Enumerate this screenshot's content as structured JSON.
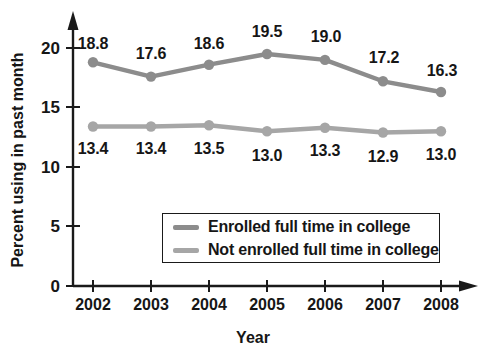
{
  "chart_data": {
    "type": "line",
    "title": "",
    "subtitle": "",
    "xlabel": "Year",
    "ylabel": "Percent using in past month",
    "categories": [
      "2002",
      "2003",
      "2004",
      "2005",
      "2006",
      "2007",
      "2008"
    ],
    "x": [
      2002,
      2003,
      2004,
      2005,
      2006,
      2007,
      2008
    ],
    "xlim": [
      2002,
      2008
    ],
    "ylim": [
      0,
      20
    ],
    "yticks": [
      "0",
      "5",
      "10",
      "15",
      "20"
    ],
    "ytick_values": [
      0,
      5,
      10,
      15,
      20
    ],
    "grid": false,
    "legend_position": "inside-lower-center",
    "series": [
      {
        "name": "Enrolled full time in college",
        "color": "#8c8c8c",
        "values": [
          18.8,
          17.6,
          18.6,
          19.5,
          19.0,
          17.2,
          16.3
        ],
        "labels": [
          "18.8",
          "17.6",
          "18.6",
          "19.5",
          "19.0",
          "17.2",
          "16.3"
        ]
      },
      {
        "name": "Not enrolled full time in college",
        "color": "#a6a6a6",
        "values": [
          13.4,
          13.4,
          13.5,
          13.0,
          13.3,
          12.9,
          13.0
        ],
        "labels": [
          "13.4",
          "13.4",
          "13.5",
          "13.0",
          "13.3",
          "12.9",
          "13.0"
        ]
      }
    ]
  },
  "axes": {
    "y_title": "Percent using in past month",
    "x_title": "Year",
    "y_tick_labels": [
      "20",
      "15",
      "10",
      "5",
      "0"
    ],
    "x_tick_labels": [
      "2002",
      "2003",
      "2004",
      "2005",
      "2006",
      "2007",
      "2008"
    ],
    "axis_color": "#1a1a1a"
  },
  "legend": {
    "items": [
      {
        "label": "Enrolled full time in college",
        "color": "#8c8c8c"
      },
      {
        "label": "Not enrolled full time in college",
        "color": "#a6a6a6"
      }
    ]
  },
  "series_labels": {
    "upper": [
      "18.8",
      "17.6",
      "18.6",
      "19.5",
      "19.0",
      "17.2",
      "16.3"
    ],
    "lower": [
      "13.4",
      "13.4",
      "13.5",
      "13.0",
      "13.3",
      "12.9",
      "13.0"
    ]
  },
  "colors": {
    "upper_line": "#8c8c8c",
    "lower_line": "#a6a6a6",
    "text": "#161616",
    "background": "#ffffff"
  }
}
